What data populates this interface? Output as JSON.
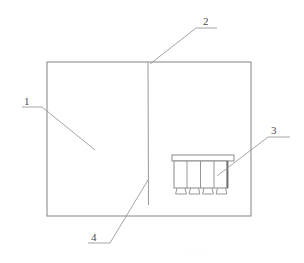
{
  "figure": {
    "type": "patent-line-drawing",
    "title": "",
    "background_color": "#ffffff",
    "line_color": "#8c8c8c",
    "line_color_dark": "#6e6e6e",
    "label_color": "#4a4a4a",
    "reference_numerals": [
      {
        "id": "1",
        "text": "1",
        "description": "left panel region of main rectangular body",
        "leader": {
          "underline": {
            "x1": 22,
            "y1": 107,
            "x2": 42,
            "y2": 107
          },
          "diagonal": {
            "x1": 42,
            "y1": 107,
            "x2": 95,
            "y2": 150
          }
        }
      },
      {
        "id": "2",
        "text": "2",
        "description": "vertical dividing line / fold at top edge",
        "leader": {
          "underline": {
            "x1": 196,
            "y1": 28,
            "x2": 216,
            "y2": 28
          },
          "diagonal": {
            "x1": 196,
            "y1": 28,
            "x2": 150,
            "y2": 63
          }
        }
      },
      {
        "id": "3",
        "text": "3",
        "description": "multi-compartment rack unit with four bays and feet",
        "leader": {
          "underline": {
            "x1": 268,
            "y1": 137,
            "x2": 290,
            "y2": 137
          },
          "diagonal": {
            "x1": 268,
            "y1": 137,
            "x2": 216,
            "y2": 176
          }
        }
      },
      {
        "id": "4",
        "text": "4",
        "description": "lower end of vertical dividing line",
        "leader": {
          "underline": {
            "x1": 88,
            "y1": 243,
            "x2": 109,
            "y2": 243
          },
          "diagonal": {
            "x1": 109,
            "y1": 243,
            "x2": 148,
            "y2": 180
          }
        }
      }
    ],
    "main_body": {
      "name": "outer-rectangle",
      "x": 47,
      "y": 62,
      "width": 204,
      "height": 154
    },
    "divider": {
      "name": "vertical-divider-line",
      "x": 148,
      "y_top": 62,
      "y_bottom": 205
    },
    "rack_unit": {
      "name": "rack-assembly",
      "cap": {
        "x": 172,
        "y": 155,
        "width": 62,
        "height": 6
      },
      "body": {
        "x": 174,
        "y": 161,
        "width": 54,
        "height": 27
      },
      "dividers_x": [
        187,
        201,
        214
      ],
      "feet_count": 4,
      "feet": [
        {
          "x": 176,
          "width": 11
        },
        {
          "x": 190,
          "width": 11
        },
        {
          "x": 204,
          "width": 11
        },
        {
          "x": 217,
          "width": 11
        }
      ],
      "foot_height": 6
    },
    "caption_artifact": "· · · ·"
  }
}
